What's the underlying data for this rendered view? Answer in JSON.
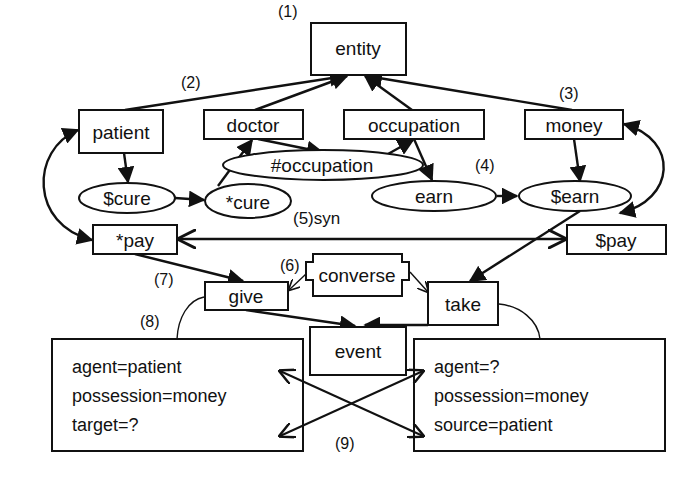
{
  "diagram": {
    "type": "semantic-network",
    "nodes": {
      "entity": "entity",
      "patient": "patient",
      "doctor": "doctor",
      "occupation": "occupation",
      "money": "money",
      "hash_occupation": "#occupation",
      "dollar_cure": "$cure",
      "star_cure": "*cure",
      "earn": "earn",
      "dollar_earn": "$earn",
      "star_pay": "*pay",
      "dollar_pay": "$pay",
      "converse": "converse",
      "give": "give",
      "take": "take",
      "event": "event"
    },
    "labels": {
      "l1": "(1)",
      "l2": "(2)",
      "l3": "(3)",
      "l4": "(4)",
      "l5": "(5)syn",
      "l6": "(6)",
      "l7": "(7)",
      "l8": "(8)",
      "l9": "(9)"
    },
    "give_attributes": [
      "agent=patient",
      "possession=money",
      "target=?"
    ],
    "take_attributes": [
      "agent=?",
      "possession=money",
      "source=patient"
    ],
    "edges": [
      {
        "from": "patient",
        "to": "entity"
      },
      {
        "from": "doctor",
        "to": "entity"
      },
      {
        "from": "occupation",
        "to": "entity"
      },
      {
        "from": "money",
        "to": "entity"
      },
      {
        "from": "patient",
        "to": "$cure"
      },
      {
        "from": "$cure",
        "to": "*cure"
      },
      {
        "from": "*cure",
        "to": "doctor"
      },
      {
        "from": "doctor",
        "to": "#occupation"
      },
      {
        "from": "#occupation",
        "to": "occupation"
      },
      {
        "from": "occupation",
        "to": "earn"
      },
      {
        "from": "earn",
        "to": "$earn"
      },
      {
        "from": "money",
        "to": "$earn"
      },
      {
        "from": "patient",
        "to": "*pay",
        "bidirectional": true
      },
      {
        "from": "money",
        "to": "$pay",
        "bidirectional": true
      },
      {
        "from": "*pay",
        "to": "$pay",
        "label": "syn",
        "bidirectional": true
      },
      {
        "from": "*pay",
        "to": "give"
      },
      {
        "from": "$earn",
        "to": "take"
      },
      {
        "from": "converse",
        "to": "give"
      },
      {
        "from": "converse",
        "to": "take"
      },
      {
        "from": "give",
        "to": "event"
      },
      {
        "from": "take",
        "to": "event"
      }
    ]
  }
}
